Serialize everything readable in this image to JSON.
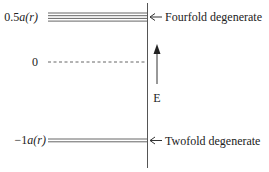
{
  "diagram": {
    "levels": [
      {
        "id": "upper",
        "label_num": "0.5",
        "label_var": "a",
        "label_arg": "(r)",
        "line_count": 4,
        "annotation": "Fourfold degenerate"
      },
      {
        "id": "zero",
        "label_num": "0",
        "label_var": "",
        "label_arg": "",
        "line_count": 1,
        "style": "dashed",
        "annotation": ""
      },
      {
        "id": "lower",
        "label_num": "−1",
        "label_var": "a",
        "label_arg": "(r)",
        "line_count": 2,
        "annotation": "Twofold degenerate"
      }
    ],
    "energy_axis_label": "E",
    "colors": {
      "ink": "#333333",
      "line": "#555555"
    }
  }
}
